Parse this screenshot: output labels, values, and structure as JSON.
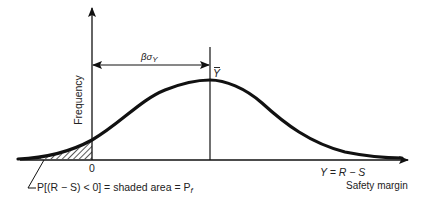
{
  "diagram": {
    "type": "probability-of-failure",
    "y_axis_label": "Frequency",
    "origin_label": "0",
    "mean_label": "Y",
    "distance_label_main": "βσ",
    "distance_label_sub": "Y",
    "x_axis_label_line1": "Y = R − S",
    "x_axis_label_line2": "Safety margin",
    "annotation": "P[(R − S) < 0] = shaded area = P",
    "annotation_sub": "f",
    "colors": {
      "ink": "#111111",
      "background": "#ffffff"
    }
  }
}
